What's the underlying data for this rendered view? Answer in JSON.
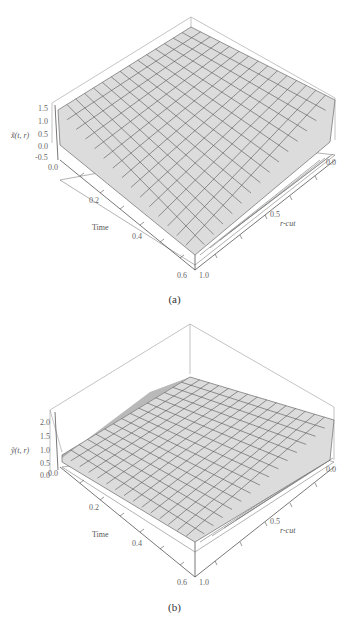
{
  "figures": [
    {
      "id": "a",
      "caption": "(a)",
      "zlabel": "x̃(t, r)",
      "xlabel": "Time",
      "ylabel": "r-cut",
      "z_ticks": [
        "1.5",
        "1.0",
        "0.5",
        "0.0",
        "-0.5"
      ],
      "time_ticks": [
        "0.0",
        "0.2",
        "0.4",
        "0.6"
      ],
      "r_ticks": [
        "0.0",
        "0.5",
        "1.0"
      ]
    },
    {
      "id": "b",
      "caption": "(b)",
      "zlabel": "ỹ(t, r)",
      "xlabel": "Time",
      "ylabel": "r-cut",
      "z_ticks": [
        "2.0",
        "1.5",
        "1.0",
        "0.5",
        "0.0"
      ],
      "time_ticks": [
        "0.0",
        "0.2",
        "0.4",
        "0.6"
      ],
      "r_ticks": [
        "0.0",
        "0.5",
        "1.0"
      ]
    }
  ],
  "chart_data": [
    {
      "type": "surface",
      "title": "(a)",
      "xlabel": "Time",
      "ylabel": "r-cut",
      "zlabel": "x̃(t, r)",
      "xlim": [
        0.0,
        0.6
      ],
      "ylim": [
        0.0,
        1.0
      ],
      "zlim": [
        -0.5,
        1.5
      ],
      "x_ticks": [
        0.0,
        0.2,
        0.4,
        0.6
      ],
      "y_ticks": [
        0.0,
        0.5,
        1.0
      ],
      "z_ticks": [
        -0.5,
        0.0,
        0.5,
        1.0,
        1.5
      ],
      "surfaces": [
        {
          "name": "upper",
          "fill": "#d9d9d9",
          "corners": {
            "t0_r0": 1.5,
            "t0_r1": 1.1,
            "t06_r0": 0.9,
            "t06_r1": 0.6
          }
        },
        {
          "name": "lower",
          "fill": "#ffffff",
          "corners": {
            "t0_r0": 0.3,
            "t0_r1": 1.1,
            "t06_r0": -0.3,
            "t06_r1": 0.6
          }
        }
      ],
      "grid": true
    },
    {
      "type": "surface",
      "title": "(b)",
      "xlabel": "Time",
      "ylabel": "r-cut",
      "zlabel": "ỹ(t, r)",
      "xlim": [
        0.0,
        0.6
      ],
      "ylim": [
        0.0,
        1.0
      ],
      "zlim": [
        0.0,
        2.0
      ],
      "x_ticks": [
        0.0,
        0.2,
        0.4,
        0.6
      ],
      "y_ticks": [
        0.0,
        0.5,
        1.0
      ],
      "z_ticks": [
        0.0,
        0.5,
        1.0,
        1.5,
        2.0
      ],
      "surfaces": [
        {
          "name": "upper",
          "fill": "#d9d9d9",
          "corners": {
            "t0_r0": 1.3,
            "t0_r1": 0.9,
            "t06_r0": 2.0,
            "t06_r1": 1.4
          }
        },
        {
          "name": "lower",
          "fill": "#ffffff",
          "corners": {
            "t0_r0": 0.5,
            "t0_r1": 0.9,
            "t06_r0": 0.8,
            "t06_r1": 1.4
          }
        }
      ],
      "grid": true
    }
  ]
}
